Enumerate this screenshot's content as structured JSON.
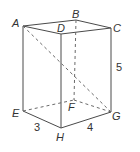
{
  "diagram": {
    "type": "rectangular-prism",
    "vertices": {
      "A": {
        "label": "A",
        "x": 23,
        "y": 26
      },
      "B": {
        "label": "B",
        "x": 76,
        "y": 20
      },
      "C": {
        "label": "C",
        "x": 111,
        "y": 28
      },
      "D": {
        "label": "D",
        "x": 61,
        "y": 34
      },
      "E": {
        "label": "E",
        "x": 23,
        "y": 111
      },
      "F": {
        "label": "F",
        "x": 74,
        "y": 100
      },
      "G": {
        "label": "G",
        "x": 111,
        "y": 112
      },
      "H": {
        "label": "H",
        "x": 61,
        "y": 128
      }
    },
    "dimensions": {
      "EH": "3",
      "HG": "4",
      "CG": "5"
    },
    "visible_edges": [
      "AB",
      "BC",
      "CD",
      "DA",
      "AE",
      "DH",
      "CG",
      "EH",
      "HG"
    ],
    "hidden_edges": [
      "BF",
      "EF",
      "FG"
    ],
    "diagonal": {
      "from": "A",
      "to": "G",
      "style": "dashed"
    },
    "colors": {
      "line": "#4a4a4a",
      "text": "#333333",
      "background": "#ffffff"
    }
  }
}
